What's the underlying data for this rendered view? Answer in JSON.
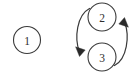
{
  "canvas": {
    "width": 139,
    "height": 80,
    "background_color": "#ffffff",
    "stroke_color": "#3a3a3a",
    "label_color": "#2e2e2e",
    "arrow_color": "#2a2a2a"
  },
  "diagram": {
    "type": "state-transition-graph",
    "nodes": [
      {
        "id": "node-1",
        "label": "1",
        "cx": 27,
        "cy": 40,
        "r": 13.5
      },
      {
        "id": "node-2",
        "label": "2",
        "cx": 102,
        "cy": 17,
        "r": 14
      },
      {
        "id": "node-3",
        "label": "3",
        "cx": 102,
        "cy": 57,
        "r": 14
      }
    ],
    "edges": [
      {
        "id": "edge-2-to-3",
        "from": "node-2",
        "to": "node-3",
        "direction": "down",
        "curve_side": "left",
        "path": "M 89.5 8.5 C 77 15, 74 38, 79.5 52",
        "arrow_points": "79.5,56.5 75.6,46.8 85.2,50.0",
        "label": ""
      },
      {
        "id": "edge-3-to-2",
        "from": "node-3",
        "to": "node-2",
        "direction": "up",
        "curve_side": "right",
        "path": "M 114.5 65.5 C 127 59, 130 36, 124.5 22",
        "arrow_points": "124.5,17.5 128.4,27.2 118.8,24.0",
        "label": ""
      }
    ]
  }
}
